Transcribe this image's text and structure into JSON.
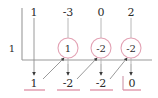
{
  "diagram": {
    "kind": "synthetic-division",
    "divisor": "1",
    "colors": {
      "rule": "#8a8a8a",
      "ink": "#2b2b2b",
      "accent": "#e8a5b8",
      "accent_line": "#de8ea5"
    },
    "columns_x": [
      34,
      68,
      101,
      131
    ],
    "bracket_x": 22,
    "rule_y": 60,
    "top_row": {
      "label": "dividend-coefficients",
      "values": [
        "1",
        "-3",
        "0",
        "2"
      ],
      "y": 12
    },
    "circled_row": {
      "label": "carried-products",
      "values": [
        "1",
        "-2",
        "-2"
      ],
      "columns_x": [
        68,
        101,
        131
      ],
      "y": 48,
      "radius": 10
    },
    "bottom_row": {
      "label": "quotient-and-remainder",
      "values": [
        "1",
        "-2",
        "-2",
        "0"
      ],
      "y": 83,
      "underline_y": 90,
      "remainder_index": 3,
      "remainder_bar_x": 122
    },
    "down_arrows": [
      {
        "x": 34,
        "y1": 18,
        "y2": 76
      },
      {
        "x": 68,
        "y1": 64,
        "y2": 76
      },
      {
        "x": 101,
        "y1": 64,
        "y2": 76
      },
      {
        "x": 131,
        "y1": 64,
        "y2": 76
      }
    ],
    "top_stems": [
      {
        "x": 68,
        "y1": 18,
        "y2": 38
      },
      {
        "x": 101,
        "y1": 18,
        "y2": 38
      },
      {
        "x": 131,
        "y1": 18,
        "y2": 38
      }
    ],
    "diagonal_arrows": [
      {
        "x1": 42,
        "y1": 78,
        "x2": 63,
        "y2": 57
      },
      {
        "x1": 76,
        "y1": 78,
        "x2": 96,
        "y2": 57
      },
      {
        "x1": 109,
        "y1": 78,
        "x2": 126,
        "y2": 57
      }
    ]
  }
}
